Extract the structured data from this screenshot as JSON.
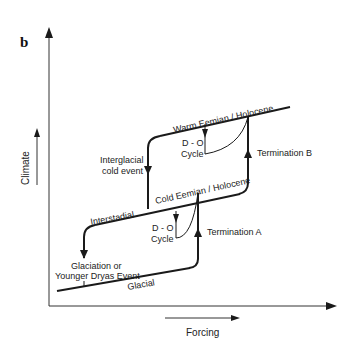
{
  "figure": {
    "panel_label": "b",
    "axes": {
      "y_label": "Climate",
      "x_label": "Forcing"
    },
    "states": {
      "warm": "Warm Eemian / Holocene",
      "cold": "Cold Eemian / Holocene",
      "glacial": "Glacial"
    },
    "events": {
      "interglacial_cold_line1": "Interglacial",
      "interglacial_cold_line2": "cold event",
      "interstadial": "Interstadial",
      "glaciation_line1": "Glaciation or",
      "glaciation_line2": "Younger Dryas Event",
      "do_upper_line1": "D - O",
      "do_upper_line2": "Cycle",
      "do_lower_line1": "D - O",
      "do_lower_line2": "Cycle",
      "termination_b": "Termination B",
      "termination_a": "Termination A"
    },
    "colors": {
      "line": "#1a1a1a",
      "axis": "#333333",
      "background": "#ffffff"
    }
  }
}
